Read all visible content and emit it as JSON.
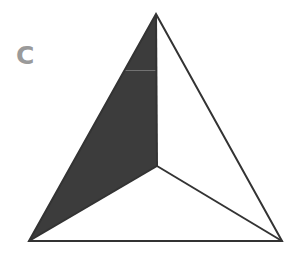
{
  "figure": {
    "panel_label": "C",
    "colors": {
      "label": "#9a9a9a",
      "shaded_region": "#3c3c3c",
      "stroke": "#333333",
      "background": "#ffffff",
      "hairline": "#8a8a8a"
    },
    "triangle": {
      "apex": [
        156,
        14
      ],
      "bottom_left": [
        29,
        241
      ],
      "bottom_right": [
        282,
        241
      ],
      "center": [
        157,
        166
      ]
    },
    "shaded_region": {
      "description": "left portion between left edge, vertical from apex to center, and line from center to bottom-left"
    }
  }
}
